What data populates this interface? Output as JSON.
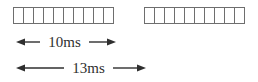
{
  "diagram": {
    "kind": "frame-timing-diagram",
    "frames": [
      {
        "name": "frame-1",
        "slot_count": 10
      },
      {
        "name": "frame-2",
        "slot_count": 10
      }
    ],
    "dimensions": [
      {
        "name": "frame-duration",
        "label": "10ms"
      },
      {
        "name": "frame-period",
        "label": "13ms"
      }
    ],
    "colors": {
      "background": "#ffffff",
      "slot_border": "#6e6e6e",
      "arrow": "#2f2f2f",
      "text": "#2f2f2f"
    }
  }
}
